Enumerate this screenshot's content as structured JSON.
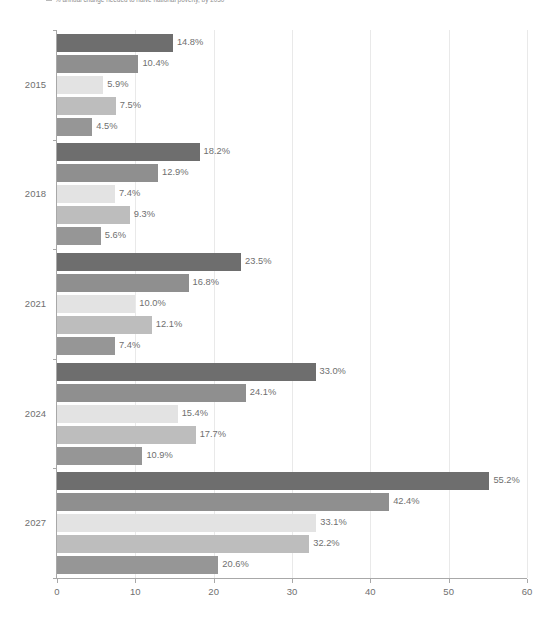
{
  "chart": {
    "title": "% annual change needed to halve national poverty, by 2030",
    "legend_marker": "legend-square-icon"
  },
  "chart_data": {
    "type": "bar",
    "orientation": "horizontal",
    "title": "% annual change needed to halve national poverty, by 2030",
    "xlabel": "",
    "ylabel": "",
    "xlim": [
      0,
      60
    ],
    "xticks": [
      0,
      10,
      20,
      30,
      40,
      50,
      60
    ],
    "xticklabels": [
      "0",
      "10",
      "20",
      "30",
      "40",
      "50",
      "60"
    ],
    "grid": "vertical",
    "legend_position": "none",
    "categories": [
      "2015",
      "2018",
      "2021",
      "2024",
      "2027"
    ],
    "series": [
      {
        "name": "series-1",
        "color": "#6e6e6e",
        "values": [
          14.8,
          18.2,
          23.5,
          33.0,
          55.2
        ],
        "labels": [
          "14.8%",
          "18.2%",
          "23.5%",
          "33.0%",
          "55.2%"
        ]
      },
      {
        "name": "series-2",
        "color": "#8f8f8f",
        "values": [
          10.4,
          12.9,
          16.8,
          24.1,
          42.4
        ],
        "labels": [
          "10.4%",
          "12.9%",
          "16.8%",
          "24.1%",
          "42.4%"
        ]
      },
      {
        "name": "series-3",
        "color": "#e3e3e3",
        "values": [
          5.9,
          7.4,
          10.0,
          15.4,
          33.1
        ],
        "labels": [
          "5.9%",
          "7.4%",
          "10.0%",
          "15.4%",
          "33.1%"
        ]
      },
      {
        "name": "series-4",
        "color": "#bdbdbd",
        "values": [
          7.5,
          9.3,
          12.1,
          17.7,
          32.2
        ],
        "labels": [
          "7.5%",
          "9.3%",
          "12.1%",
          "17.7%",
          "32.2%"
        ]
      },
      {
        "name": "series-5",
        "color": "#969696",
        "values": [
          4.5,
          5.6,
          7.4,
          10.9,
          20.6
        ],
        "labels": [
          "4.5%",
          "5.6%",
          "7.4%",
          "10.9%",
          "20.6%"
        ]
      }
    ]
  }
}
